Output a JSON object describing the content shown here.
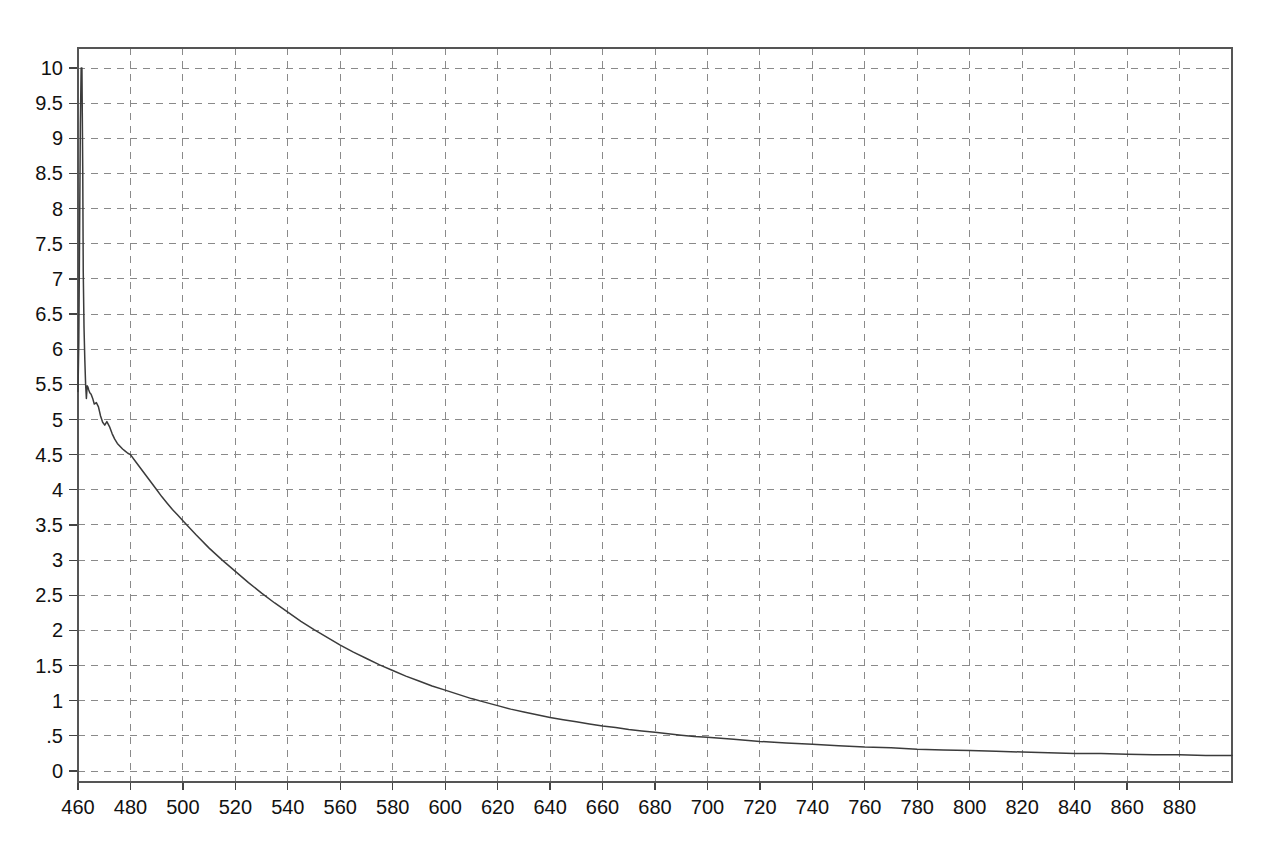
{
  "chart_data": {
    "type": "line",
    "title": "",
    "subtitle": "",
    "xlabel": "",
    "ylabel": "",
    "xlim": [
      460,
      900
    ],
    "ylim": [
      0,
      10
    ],
    "grid": true,
    "legend": null,
    "legend_position": "none",
    "background_color": "#ffffff",
    "line_color": "#3b3b3b",
    "grid_color": "#8a8a8a",
    "axis_color": "#555555",
    "x_ticks": [
      460,
      480,
      500,
      520,
      540,
      560,
      580,
      600,
      620,
      640,
      660,
      680,
      700,
      720,
      740,
      760,
      780,
      800,
      820,
      840,
      860,
      880
    ],
    "x_tick_labels": [
      "460",
      "480",
      "500",
      "520",
      "540",
      "560",
      "580",
      "600",
      "620",
      "640",
      "660",
      "680",
      "700",
      "720",
      "740",
      "760",
      "780",
      "800",
      "820",
      "840",
      "860",
      "880"
    ],
    "y_ticks": [
      0,
      0.5,
      1,
      1.5,
      2,
      2.5,
      3,
      3.5,
      4,
      4.5,
      5,
      5.5,
      6,
      6.5,
      7,
      7.5,
      8,
      8.5,
      9,
      9.5,
      10
    ],
    "y_tick_labels": [
      "0",
      ".5",
      "1",
      "1.5",
      "2",
      "2.5",
      "3",
      "3.5",
      "4",
      "4.5",
      "5",
      "5.5",
      "6",
      "6.5",
      "7",
      "7.5",
      "8",
      "8.5",
      "9",
      "9.5",
      "10"
    ],
    "series": [
      {
        "name": "signal",
        "x": [
          460.0,
          460.3,
          460.6,
          460.9,
          461.2,
          461.5,
          461.8,
          462.0,
          462.3,
          462.6,
          462.9,
          463.2,
          463.5,
          463.8,
          464.1,
          464.5,
          465.0,
          465.6,
          466.2,
          467.0,
          467.8,
          468.6,
          469.4,
          470.2,
          471.0,
          472.0,
          473.0,
          474.0,
          475.0,
          476.0,
          477.0,
          478.0,
          479.0,
          480.0,
          482.0,
          484.0,
          486.0,
          488.0,
          490.0,
          492.0,
          494.0,
          496.0,
          498.0,
          500.0,
          505.0,
          510.0,
          515.0,
          520.0,
          525.0,
          530.0,
          535.0,
          540.0,
          545.0,
          550.0,
          555.0,
          560.0,
          565.0,
          570.0,
          575.0,
          580.0,
          585.0,
          590.0,
          595.0,
          600.0,
          605.0,
          610.0,
          615.0,
          620.0,
          625.0,
          630.0,
          635.0,
          640.0,
          645.0,
          650.0,
          655.0,
          660.0,
          665.0,
          670.0,
          675.0,
          680.0,
          685.0,
          690.0,
          695.0,
          700.0,
          710.0,
          720.0,
          730.0,
          740.0,
          750.0,
          760.0,
          770.0,
          780.0,
          790.0,
          800.0,
          810.0,
          820.0,
          830.0,
          840.0,
          850.0,
          860.0,
          870.0,
          880.0,
          890.0,
          900.0
        ],
        "y": [
          5.4,
          6.1,
          7.6,
          9.2,
          10.0,
          10.0,
          8.6,
          7.1,
          6.3,
          5.85,
          5.5,
          5.3,
          5.48,
          5.46,
          5.42,
          5.38,
          5.36,
          5.3,
          5.22,
          5.24,
          5.18,
          5.05,
          4.96,
          4.92,
          4.97,
          4.9,
          4.8,
          4.72,
          4.66,
          4.62,
          4.58,
          4.55,
          4.52,
          4.5,
          4.4,
          4.3,
          4.2,
          4.1,
          4.0,
          3.9,
          3.81,
          3.72,
          3.64,
          3.56,
          3.36,
          3.17,
          3.0,
          2.84,
          2.68,
          2.53,
          2.39,
          2.26,
          2.13,
          2.01,
          1.9,
          1.79,
          1.69,
          1.6,
          1.51,
          1.43,
          1.35,
          1.28,
          1.21,
          1.15,
          1.09,
          1.03,
          0.98,
          0.93,
          0.88,
          0.84,
          0.8,
          0.76,
          0.73,
          0.7,
          0.67,
          0.64,
          0.62,
          0.59,
          0.57,
          0.55,
          0.53,
          0.51,
          0.49,
          0.48,
          0.45,
          0.42,
          0.4,
          0.38,
          0.36,
          0.34,
          0.33,
          0.31,
          0.3,
          0.29,
          0.28,
          0.27,
          0.26,
          0.25,
          0.25,
          0.24,
          0.23,
          0.23,
          0.22,
          0.22
        ],
        "color": "#3b3b3b"
      }
    ],
    "annotations": []
  },
  "plot": {
    "left_px": 78,
    "top_px": 48,
    "right_px": 1232,
    "bottom_px": 782,
    "y_top_value_px": 68,
    "y_zero_value_px": 771
  }
}
